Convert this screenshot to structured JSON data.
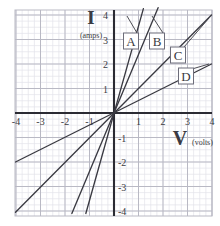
{
  "figure": {
    "background": "#ffffff",
    "grid": {
      "major_color": "#b9b9c4",
      "minor_color": "#e2e2ea",
      "major_step_px": 24.5,
      "minor_per_major": 4,
      "left_px": 15,
      "top_px": 10,
      "right_px": 212,
      "bottom_px": 216
    },
    "axes": {
      "origin_px": {
        "x": 114,
        "y": 113
      },
      "color": "#2b2b33",
      "x_axis": {
        "name": "V",
        "unit": "(volts)",
        "ticks": [
          -4,
          -3,
          -2,
          -1,
          1,
          2,
          3,
          4
        ],
        "tick_labels": [
          "-4",
          "-3",
          "-2",
          "-1",
          "1",
          "2",
          "3",
          "4"
        ],
        "label_x_px": 183,
        "label_y_px": 140
      },
      "y_axis": {
        "name": "I",
        "unit": "(amps)",
        "ticks": [
          4,
          3,
          2,
          1,
          -1,
          -2,
          -3,
          -4
        ],
        "tick_labels": [
          "4",
          "3",
          "2",
          "1",
          "-1",
          "-2",
          "-3",
          "-4"
        ],
        "label_x_px": 91,
        "label_y_px": 22
      }
    }
  },
  "chart_data": {
    "type": "line",
    "title": "",
    "xlabel": "V (volts)",
    "ylabel": "I (amps)",
    "xlim": [
      -4.05,
      4.0
    ],
    "ylim": [
      -4.2,
      4.2
    ],
    "grid": true,
    "legend": "inline-boxed-labels",
    "series": [
      {
        "name": "A",
        "slope": 3.55,
        "label": "A",
        "label_px": {
          "x": 131,
          "y": 41
        },
        "leader_from_px": {
          "x": 137,
          "y": 33
        },
        "leader_to_px": {
          "x": 127,
          "y": 16
        },
        "points": [
          [
            -1.15,
            -4.1
          ],
          [
            1.2,
            4.26
          ]
        ]
      },
      {
        "name": "B",
        "slope": 2.4,
        "label": "B",
        "label_px": {
          "x": 157,
          "y": 41
        },
        "leader_from_px": {
          "x": 163,
          "y": 33
        },
        "leader_to_px": {
          "x": 152,
          "y": 16
        },
        "points": [
          [
            -1.72,
            -4.1
          ],
          [
            1.8,
            4.3
          ]
        ]
      },
      {
        "name": "C",
        "slope": 1.0,
        "label": "C",
        "label_px": {
          "x": 178,
          "y": 55
        },
        "leader_from_px": {
          "x": 184,
          "y": 47
        },
        "leader_to_px": {
          "x": 209,
          "y": 18
        },
        "points": [
          [
            -4.02,
            -4.05
          ],
          [
            3.98,
            4.0
          ]
        ]
      },
      {
        "name": "D",
        "slope": 0.5,
        "label": "D",
        "label_px": {
          "x": 186,
          "y": 76
        },
        "leader_from_px": {
          "x": 192,
          "y": 69
        },
        "leader_to_px": {
          "x": 209,
          "y": 64
        },
        "points": [
          [
            -4.02,
            -2.0
          ],
          [
            3.98,
            2.0
          ]
        ]
      }
    ],
    "line_color": "#3a3a42",
    "label_box": {
      "fill": "#ffffff",
      "stroke": "#6d6d7a"
    }
  }
}
